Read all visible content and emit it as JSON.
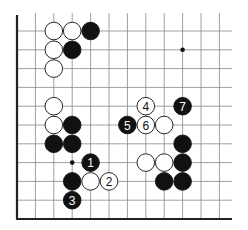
{
  "diagram": {
    "type": "go-board-fragment",
    "edges": [
      "left",
      "bottom"
    ],
    "grid": {
      "x0": 17,
      "dx": 18.4,
      "cols": 12,
      "y0": 31,
      "dy": 18.8,
      "rows": 11,
      "top_open_y": 13,
      "right_open_x": 232
    },
    "star_points": [
      {
        "col": 9,
        "row": 1
      },
      {
        "col": 3,
        "row": 7
      }
    ],
    "stones": [
      {
        "col": 2,
        "row": 0,
        "color": "white",
        "label": ""
      },
      {
        "col": 3,
        "row": 0,
        "color": "white",
        "label": ""
      },
      {
        "col": 4,
        "row": 0,
        "color": "black",
        "label": ""
      },
      {
        "col": 2,
        "row": 1,
        "color": "white",
        "label": ""
      },
      {
        "col": 3,
        "row": 1,
        "color": "black",
        "label": ""
      },
      {
        "col": 2,
        "row": 2,
        "color": "white",
        "label": ""
      },
      {
        "col": 2,
        "row": 4,
        "color": "white",
        "label": ""
      },
      {
        "col": 2,
        "row": 5,
        "color": "white",
        "label": ""
      },
      {
        "col": 3,
        "row": 5,
        "color": "black",
        "label": ""
      },
      {
        "col": 2,
        "row": 6,
        "color": "black",
        "label": ""
      },
      {
        "col": 3,
        "row": 6,
        "color": "black",
        "label": ""
      },
      {
        "col": 4,
        "row": 7,
        "color": "black",
        "label": "1"
      },
      {
        "col": 3,
        "row": 8,
        "color": "black",
        "label": ""
      },
      {
        "col": 4,
        "row": 8,
        "color": "white",
        "label": ""
      },
      {
        "col": 5,
        "row": 8,
        "color": "white",
        "label": "2"
      },
      {
        "col": 3,
        "row": 9,
        "color": "black",
        "label": "3"
      },
      {
        "col": 7,
        "row": 4,
        "color": "white",
        "label": "4"
      },
      {
        "col": 9,
        "row": 4,
        "color": "black",
        "label": "7"
      },
      {
        "col": 6,
        "row": 5,
        "color": "black",
        "label": "5"
      },
      {
        "col": 7,
        "row": 5,
        "color": "white",
        "label": "6"
      },
      {
        "col": 8,
        "row": 5,
        "color": "white",
        "label": ""
      },
      {
        "col": 9,
        "row": 6,
        "color": "black",
        "label": ""
      },
      {
        "col": 7,
        "row": 7,
        "color": "white",
        "label": ""
      },
      {
        "col": 8,
        "row": 7,
        "color": "white",
        "label": ""
      },
      {
        "col": 9,
        "row": 7,
        "color": "black",
        "label": ""
      },
      {
        "col": 8,
        "row": 8,
        "color": "black",
        "label": ""
      },
      {
        "col": 9,
        "row": 8,
        "color": "black",
        "label": ""
      }
    ],
    "colors": {
      "black_stone": "#111111",
      "white_stone": "#ffffff",
      "grid": "#888888",
      "edge": "#222222"
    }
  }
}
